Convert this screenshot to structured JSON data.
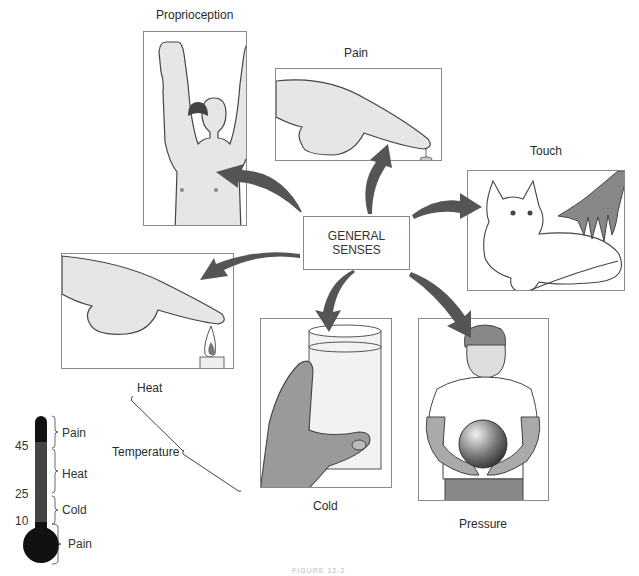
{
  "diagram": {
    "center": {
      "line1": "GENERAL",
      "line2": "SENSES"
    },
    "senses": [
      {
        "id": "proprioception",
        "label": "Proprioception",
        "image": "man-raising-arms-eyes-closed"
      },
      {
        "id": "pain",
        "label": "Pain",
        "image": "finger-pressing-pin"
      },
      {
        "id": "touch",
        "label": "Touch",
        "image": "hand-petting-cat"
      },
      {
        "id": "heat",
        "label": "Heat",
        "image": "finger-over-candle-flame"
      },
      {
        "id": "cold",
        "label": "Cold",
        "image": "hand-holding-glass-of-water"
      },
      {
        "id": "pressure",
        "label": "Pressure",
        "image": "boy-holding-ball"
      }
    ],
    "temperature_bracket_label": "Temperature",
    "thermometer": {
      "ticks": [
        "45",
        "25",
        "10"
      ],
      "ranges": [
        "Pain",
        "Heat",
        "Cold",
        "Pain"
      ]
    },
    "caption": "FIGURE 12-2"
  },
  "colors": {
    "frame": "#8a8a8a",
    "arrow_dark": "#3a3a3a",
    "arrow_light": "#d8d8d8",
    "thermometer": "#111111",
    "thermometer_mid": "#444444"
  }
}
